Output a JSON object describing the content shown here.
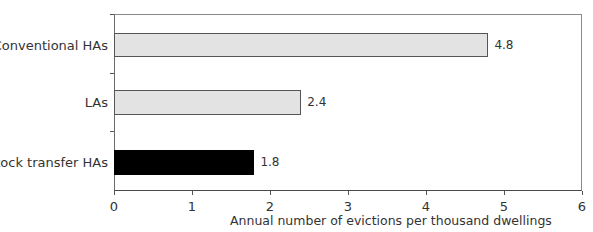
{
  "chart_data": {
    "type": "bar",
    "orientation": "horizontal",
    "title": "",
    "categories": [
      "Conventional HAs",
      "LAs",
      "Stock transfer HAs"
    ],
    "values": [
      4.8,
      2.4,
      1.8
    ],
    "value_labels": [
      "4.8",
      "2.4",
      "1.8"
    ],
    "bar_colors": [
      "#e3e3e3",
      "#e3e3e3",
      "#000000"
    ],
    "xlabel": "Annual number of evictions per thousand dwellings",
    "ylabel": "",
    "xlim": [
      0,
      6
    ],
    "xticks": [
      "0",
      "1",
      "2",
      "3",
      "4",
      "5",
      "6"
    ],
    "grid": false,
    "legend": null
  }
}
